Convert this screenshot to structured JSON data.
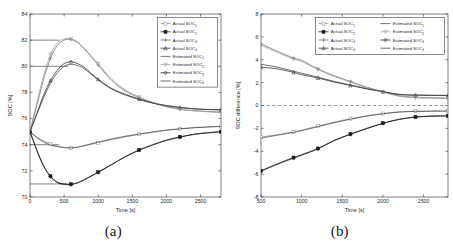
{
  "figure": {
    "panels": [
      {
        "caption": "(a)",
        "xlabel": "Time [s]",
        "ylabel": "SOC [%]",
        "xticks": [
          0,
          500,
          1000,
          1500,
          2000,
          2500
        ],
        "xtick_labels": [
          "0",
          "500",
          "1000",
          "1500",
          "2000",
          "2500"
        ],
        "yticks": [
          70,
          72,
          74,
          76,
          78,
          80,
          82,
          84
        ],
        "ytick_labels": [
          "70",
          "72",
          "74",
          "76",
          "78",
          "80",
          "82",
          "84"
        ],
        "xlim": [
          0,
          2800
        ],
        "ylim": [
          70,
          84
        ],
        "legend_columns": 1
      },
      {
        "caption": "(b)",
        "xlabel": "Time [s]",
        "ylabel": "SOC difference [%]",
        "xticks": [
          500,
          1000,
          1500,
          2000,
          2500
        ],
        "xtick_labels": [
          "500",
          "1000",
          "1500",
          "2000",
          "2500"
        ],
        "yticks": [
          -8,
          -6,
          -4,
          -2,
          0,
          2,
          4,
          6,
          8
        ],
        "ytick_labels": [
          "-8",
          "-6",
          "-4",
          "-2",
          "0",
          "2",
          "4",
          "6",
          "8"
        ],
        "xlim": [
          500,
          2800
        ],
        "ylim": [
          -8,
          8
        ],
        "legend_columns": 2
      }
    ]
  },
  "chart_data": [
    {
      "type": "line",
      "panel": "(a)",
      "title": "",
      "xlabel": "Time [s]",
      "ylabel": "SOC [%]",
      "xlim": [
        0,
        2800
      ],
      "ylim": [
        70,
        84
      ],
      "grid": false,
      "legend_position": "upper right",
      "reference_lines": [
        {
          "type": "horizontal-segment",
          "y": 82,
          "x_from": 0,
          "x_to": 430,
          "style": "solid"
        },
        {
          "type": "horizontal-segment",
          "y": 80,
          "x_from": 0,
          "x_to": 560,
          "style": "solid"
        },
        {
          "type": "horizontal-segment",
          "y": 74,
          "x_from": 0,
          "x_to": 430,
          "style": "solid"
        },
        {
          "type": "horizontal-segment",
          "y": 71,
          "x_from": 0,
          "x_to": 560,
          "style": "solid"
        }
      ],
      "x": [
        0,
        100,
        200,
        300,
        400,
        500,
        600,
        700,
        800,
        1000,
        1200,
        1400,
        1600,
        1800,
        2000,
        2200,
        2400,
        2600,
        2800
      ],
      "series": [
        {
          "name": "Actual SOC₁",
          "marker": "square-open",
          "color": "#8a8a8a",
          "values": [
            75.0,
            74.6,
            74.3,
            74.05,
            73.9,
            73.8,
            73.75,
            73.8,
            73.9,
            74.15,
            74.4,
            74.6,
            74.8,
            74.95,
            75.1,
            75.2,
            75.3,
            75.35,
            75.4
          ]
        },
        {
          "name": "Actual SOC₂",
          "marker": "square-filled",
          "color": "#1a1a1a",
          "values": [
            75.0,
            73.6,
            72.4,
            71.6,
            71.15,
            71.0,
            70.98,
            71.1,
            71.35,
            71.9,
            72.5,
            73.1,
            73.6,
            74.0,
            74.35,
            74.6,
            74.8,
            74.92,
            75.0
          ]
        },
        {
          "name": "Actual SOC₃",
          "marker": "plus",
          "color": "#6b6b6b",
          "values": [
            75.0,
            77.0,
            79.0,
            80.6,
            81.6,
            82.0,
            82.05,
            81.8,
            81.3,
            80.1,
            78.9,
            78.1,
            77.6,
            77.2,
            76.9,
            76.7,
            76.6,
            76.55,
            76.5
          ]
        },
        {
          "name": "Actual SOC₄",
          "marker": "triangle-up",
          "color": "#2b2b2b",
          "values": [
            75.0,
            76.4,
            77.8,
            78.9,
            79.7,
            80.2,
            80.35,
            80.2,
            79.9,
            79.0,
            78.3,
            77.85,
            77.5,
            77.2,
            77.0,
            76.85,
            76.75,
            76.7,
            76.68
          ]
        },
        {
          "name": "Estimated SOC₁",
          "marker": "none",
          "color": "#4a4a4a",
          "values": [
            75.0,
            74.55,
            74.2,
            73.98,
            73.85,
            73.78,
            73.76,
            73.82,
            73.95,
            74.2,
            74.45,
            74.65,
            74.82,
            74.98,
            75.12,
            75.22,
            75.3,
            75.36,
            75.4
          ]
        },
        {
          "name": "Estimated SOC₂",
          "marker": "triangle-down",
          "color": "#9a9a9a",
          "values": [
            75.0,
            77.2,
            79.3,
            80.9,
            81.8,
            82.1,
            82.1,
            81.85,
            81.35,
            80.2,
            79.0,
            78.2,
            77.65,
            77.25,
            76.95,
            76.72,
            76.6,
            76.52,
            76.45
          ]
        },
        {
          "name": "Estimated SOC₃",
          "marker": "diamond",
          "color": "#1a1a1a",
          "values": [
            75.0,
            73.55,
            72.35,
            71.55,
            71.1,
            70.97,
            70.95,
            71.08,
            71.32,
            71.88,
            72.48,
            73.08,
            73.58,
            73.98,
            74.33,
            74.58,
            74.78,
            74.9,
            74.98
          ]
        },
        {
          "name": "Estimated SOC₄",
          "marker": "none",
          "color": "#3a3a3a",
          "values": [
            75.0,
            76.3,
            77.6,
            78.7,
            79.5,
            80.0,
            80.15,
            80.05,
            79.8,
            78.95,
            78.25,
            77.8,
            77.45,
            77.18,
            76.98,
            76.84,
            76.74,
            76.69,
            76.66
          ]
        }
      ]
    },
    {
      "type": "line",
      "panel": "(b)",
      "title": "",
      "xlabel": "Time [s]",
      "ylabel": "SOC difference [%]",
      "xlim": [
        500,
        2800
      ],
      "ylim": [
        -8,
        8
      ],
      "grid": false,
      "legend_position": "upper right",
      "reference_lines": [
        {
          "type": "horizontal",
          "y": 0,
          "style": "dashed"
        }
      ],
      "x": [
        500,
        700,
        900,
        1000,
        1200,
        1400,
        1600,
        1800,
        2000,
        2200,
        2400,
        2600,
        2800
      ],
      "series": [
        {
          "name": "Actual SOC₁",
          "marker": "square-open",
          "color": "#8a8a8a",
          "values": [
            -2.75,
            -2.55,
            -2.3,
            -2.15,
            -1.8,
            -1.45,
            -1.15,
            -0.9,
            -0.7,
            -0.55,
            -0.5,
            -0.48,
            -0.47
          ]
        },
        {
          "name": "Actual SOC₂",
          "marker": "square-filled",
          "color": "#1a1a1a",
          "values": [
            -5.7,
            -5.1,
            -4.55,
            -4.3,
            -3.75,
            -3.05,
            -2.5,
            -2.0,
            -1.55,
            -1.2,
            -1.0,
            -0.92,
            -0.9
          ]
        },
        {
          "name": "Actual SOC₃",
          "marker": "plus",
          "color": "#6b6b6b",
          "values": [
            5.4,
            4.75,
            4.15,
            3.95,
            3.2,
            2.6,
            2.1,
            1.6,
            1.2,
            0.85,
            0.72,
            0.68,
            0.65
          ]
        },
        {
          "name": "Actual SOC₄",
          "marker": "triangle-up",
          "color": "#2b2b2b",
          "values": [
            3.35,
            3.2,
            2.9,
            2.7,
            2.4,
            2.05,
            1.75,
            1.45,
            1.2,
            0.95,
            0.9,
            0.88,
            0.87
          ]
        },
        {
          "name": "Estimated SOC₁",
          "marker": "none",
          "color": "#4a4a4a",
          "values": [
            -2.85,
            -2.6,
            -2.35,
            -2.2,
            -1.85,
            -1.5,
            -1.2,
            -0.93,
            -0.73,
            -0.58,
            -0.52,
            -0.5,
            -0.49
          ]
        },
        {
          "name": "Estimated SOC₂",
          "marker": "triangle-down",
          "color": "#9a9a9a",
          "values": [
            5.25,
            4.65,
            4.05,
            3.85,
            3.15,
            2.55,
            2.05,
            1.58,
            1.18,
            0.8,
            0.68,
            0.63,
            0.6
          ]
        },
        {
          "name": "Estimated SOC₃",
          "marker": "diamond",
          "color": "#1a1a1a",
          "values": [
            -5.75,
            -5.15,
            -4.6,
            -4.35,
            -3.8,
            -3.08,
            -2.52,
            -2.02,
            -1.57,
            -1.22,
            -1.02,
            -0.94,
            -0.92
          ]
        },
        {
          "name": "Estimated SOC₄",
          "marker": "none",
          "color": "#3a3a3a",
          "values": [
            3.6,
            3.35,
            3.0,
            2.82,
            2.48,
            2.1,
            1.8,
            1.48,
            1.22,
            0.98,
            0.92,
            0.9,
            0.89
          ]
        }
      ]
    }
  ]
}
